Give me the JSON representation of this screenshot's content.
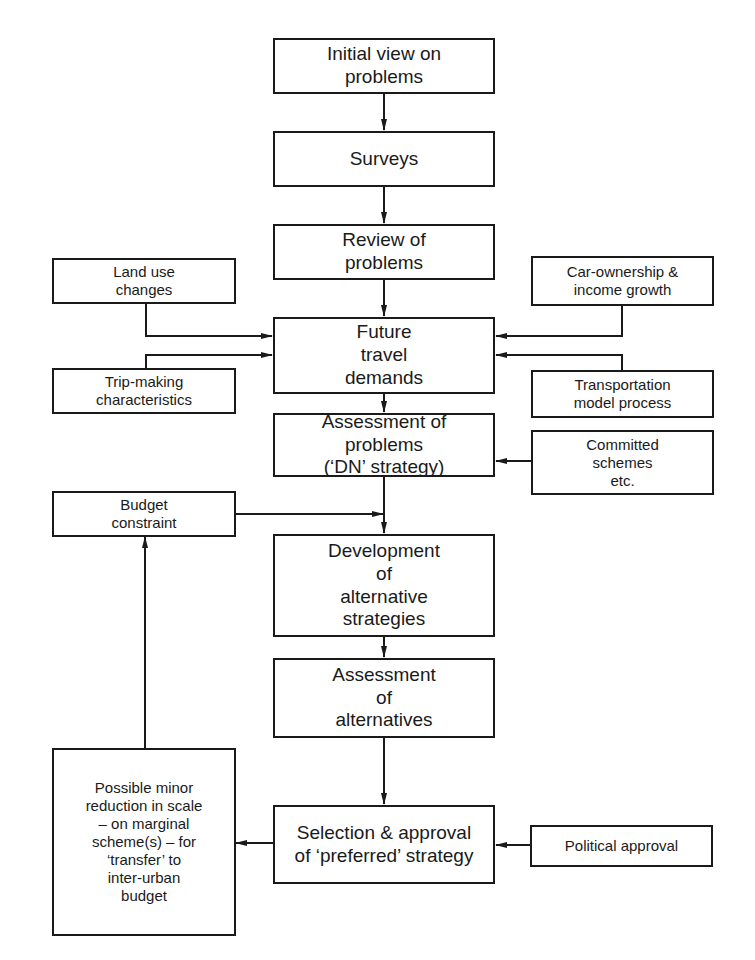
{
  "diagram": {
    "type": "flowchart",
    "nodes": {
      "initial_view": "Initial view on\nproblems",
      "surveys": "Surveys",
      "review": "Review of\nproblems",
      "future_demands": "Future\ntravel\ndemands",
      "assessment_problems": "Assessment of\nproblems\n(‘DN’ strategy)",
      "development": "Development\nof\nalternative\nstrategies",
      "assessment_alternatives": "Assessment\nof\nalternatives",
      "selection": "Selection & approval\nof ‘preferred’ strategy",
      "land_use": "Land use\nchanges",
      "trip_making": "Trip-making\ncharacteristics",
      "car_ownership": "Car-ownership &\nincome growth",
      "transport_model": "Transportation\nmodel process",
      "committed": "Committed\nschemes\netc.",
      "budget": "Budget\nconstraint",
      "reduction": "Possible minor\nreduction in scale\n– on marginal\nscheme(s) – for\n‘transfer’ to\ninter-urban\nbudget",
      "political": "Political  approval"
    },
    "edges": [
      [
        "initial_view",
        "surveys"
      ],
      [
        "surveys",
        "review"
      ],
      [
        "review",
        "future_demands"
      ],
      [
        "land_use",
        "future_demands"
      ],
      [
        "trip_making",
        "future_demands"
      ],
      [
        "car_ownership",
        "future_demands"
      ],
      [
        "transport_model",
        "future_demands"
      ],
      [
        "future_demands",
        "assessment_problems"
      ],
      [
        "committed",
        "assessment_problems"
      ],
      [
        "assessment_problems",
        "development"
      ],
      [
        "budget",
        "development"
      ],
      [
        "development",
        "assessment_alternatives"
      ],
      [
        "assessment_alternatives",
        "selection"
      ],
      [
        "political",
        "selection"
      ],
      [
        "selection",
        "reduction"
      ],
      [
        "reduction",
        "budget"
      ]
    ]
  }
}
